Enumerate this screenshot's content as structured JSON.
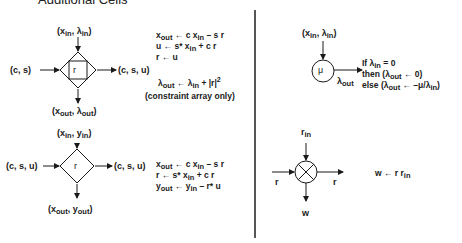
{
  "title": "Additional Cells",
  "cells": {
    "boundary_rotation": {
      "inputs": {
        "top": {
          "a": "x",
          "a_sub": "in",
          "sep": ", ",
          "b": "λ",
          "b_sub": "in"
        },
        "left": "(c, s)"
      },
      "outputs": {
        "right": "(c, s, u)",
        "bottom": {
          "a": "x",
          "a_sub": "out",
          "sep": ", ",
          "b": "λ",
          "b_sub": "out"
        }
      },
      "symbol": "r",
      "equations": [
        {
          "lhs": "x",
          "lhs_sub": "out",
          "arrow": " ← ",
          "rhs": "c x",
          "rhs_sub": "in",
          "rhs_tail": " – s r"
        },
        {
          "lhs": "u",
          "lhs_sub": "",
          "arrow": " ← ",
          "rhs": "s* x",
          "rhs_sub": "in",
          "rhs_tail": " + c r"
        },
        {
          "lhs": "r",
          "lhs_sub": "",
          "arrow": " ← ",
          "rhs": "u",
          "rhs_sub": "",
          "rhs_tail": ""
        }
      ],
      "lambda_update": {
        "lhs": "λ",
        "lhs_sub": "out",
        "arrow": " ← ",
        "rhs": "λ",
        "rhs_sub": "in",
        "tail": " + |r|",
        "exp": "2"
      },
      "note": "(constraint array only)"
    },
    "mu_cell": {
      "input": {
        "a": "x",
        "a_sub": "in",
        "sep": ", ",
        "b": "λ",
        "b_sub": "in"
      },
      "symbol": "μ",
      "output": {
        "a": "λ",
        "a_sub": "out"
      },
      "rules": [
        {
          "pre": "If λ",
          "sub": "in",
          "post": "  =  0"
        },
        {
          "pre": "then (λ",
          "sub": "out",
          "post": " ← 0)"
        },
        {
          "pre": "else  (λ",
          "sub": "out",
          "post": " ← –μ/λ",
          "sub2": "in",
          "post2": ")"
        }
      ]
    },
    "internal_rotation": {
      "inputs": {
        "top": {
          "a": "x",
          "a_sub": "in",
          "sep": ", ",
          "b": "y",
          "b_sub": "in"
        },
        "left": "(c, s, u)"
      },
      "outputs": {
        "right": "(c, s, u)",
        "bottom": {
          "a": "x",
          "a_sub": "out",
          "sep": ", ",
          "b": "y",
          "b_sub": "out"
        }
      },
      "symbol": "r",
      "equations": [
        {
          "lhs": "x",
          "lhs_sub": "out",
          "arrow": " ← ",
          "rhs": "c x",
          "rhs_sub": "in",
          "rhs_tail": " – s r"
        },
        {
          "lhs": "r",
          "lhs_sub": "",
          "arrow": " ← ",
          "rhs": "s* x",
          "rhs_sub": "in",
          "rhs_tail": " + c r"
        },
        {
          "lhs": "y",
          "lhs_sub": "out",
          "arrow": " ← ",
          "rhs": "y",
          "rhs_sub": "in",
          "rhs_tail": " – r* u"
        }
      ]
    },
    "multiplier": {
      "input_top": {
        "a": "r",
        "a_sub": "in"
      },
      "input_left": "r",
      "output_right": "r",
      "output_bottom": "w",
      "symbol": "⊗",
      "equation": {
        "lhs": "w",
        "arrow": " ← ",
        "rhs": "r r",
        "rhs_sub": "in"
      }
    }
  },
  "colors": {
    "ink": "#1a1a1a",
    "divider": "#555555",
    "background": "#ffffff"
  }
}
